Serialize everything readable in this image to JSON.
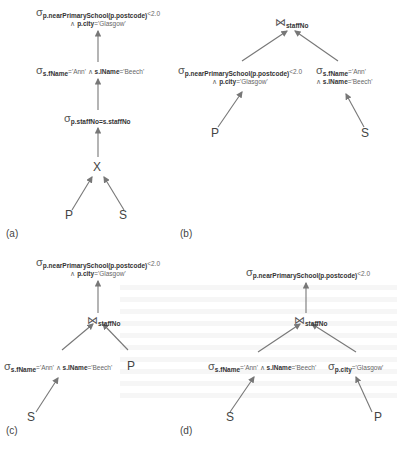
{
  "panels": {
    "a": {
      "label": "(a)",
      "nodes": {
        "top_sel": {
          "op": "σ",
          "cond1": "p.nearPrimarySchool(p.postcode)",
          "cond1_rest": "<2.0",
          "cond2_and": "∧",
          "cond2": "p.city",
          "cond2_rest": "='Glasgow'"
        },
        "mid_sel": {
          "op": "σ",
          "c1": "s.fName",
          "c1_rest": "='Ann'",
          "and": "∧",
          "c2": "s.lName",
          "c2_rest": "='Beech'"
        },
        "low_sel": {
          "op": "σ",
          "cond": "p.staffNo=s.staffNo"
        },
        "product": {
          "op": "X"
        },
        "leaf_left": "P",
        "leaf_right": "S"
      }
    },
    "b": {
      "label": "(b)",
      "nodes": {
        "join": {
          "op": "⋈",
          "cond": "staffNo"
        },
        "left_sel": {
          "op": "σ",
          "cond1": "p.nearPrimarySchool(p.postcode)",
          "cond1_rest": "<2.0",
          "cond2_and": "∧",
          "cond2": "p.city",
          "cond2_rest": "='Glasgow'"
        },
        "right_sel": {
          "op": "σ",
          "c1": "s.fName",
          "c1_rest": "='Ann'",
          "and": "∧",
          "c2": "s.lName",
          "c2_rest": "='Beech'"
        },
        "leaf_left": "P",
        "leaf_right": "S"
      }
    },
    "c": {
      "label": "(c)",
      "nodes": {
        "top_sel": {
          "op": "σ",
          "cond1": "p.nearPrimarySchool(p.postcode)",
          "cond1_rest": "<2.0",
          "cond2_and": "∧",
          "cond2": "p.city",
          "cond2_rest": "='Glasgow'"
        },
        "join": {
          "op": "⋈",
          "cond": "staffNo"
        },
        "left_sel": {
          "op": "σ",
          "c1": "s.fName",
          "c1_rest": "='Ann'",
          "and": "∧",
          "c2": "s.lName",
          "c2_rest": "='Beech'"
        },
        "leaf_right": "P",
        "leaf_bottom": "S"
      }
    },
    "d": {
      "label": "(d)",
      "nodes": {
        "top_sel": {
          "op": "σ",
          "cond1": "p.nearPrimarySchool(p.postcode)",
          "cond1_rest": "<2.0"
        },
        "join": {
          "op": "⋈",
          "cond": "staffNo"
        },
        "left_sel": {
          "op": "σ",
          "c1": "s.fName",
          "c1_rest": "='Ann'",
          "and": "∧",
          "c2": "s.lName",
          "c2_rest": "='Beech'"
        },
        "right_sel": {
          "op": "σ",
          "c1": "p.city",
          "c1_rest": "='Glasgow'"
        },
        "leaf_left": "S",
        "leaf_right": "P"
      }
    }
  },
  "colors": {
    "edge": "#777777",
    "text": "#333333"
  }
}
